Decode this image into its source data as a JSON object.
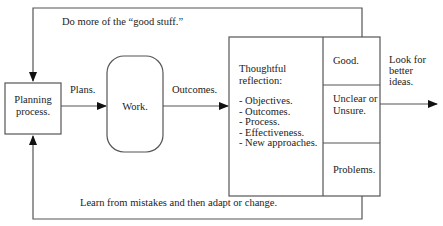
{
  "diagram": {
    "type": "feedback-loop flowchart",
    "colors": {
      "line": "#555555",
      "arrow": "#111111",
      "text": "#222222",
      "background": "#ffffff"
    },
    "nodes": {
      "planning": {
        "label_line1": "Planning",
        "label_line2": "process."
      },
      "work": {
        "label": "Work."
      },
      "reflection": {
        "title_line1": "Thoughtful",
        "title_line2": "reflection:",
        "items": [
          "- Objectives.",
          "- Outcomes.",
          "- Process.",
          "- Effectiveness.",
          "- New approaches."
        ]
      },
      "results": {
        "good": "Good.",
        "unclear_line1": "Unclear or",
        "unclear_line2": "Unsure.",
        "problems": "Problems."
      }
    },
    "edges": {
      "plans": "Plans.",
      "outcomes": "Outcomes.",
      "top_loop": "Do more of the “good stuff.”",
      "bottom_loop": "Learn from mistakes and then adapt or change.",
      "output_line1": "Look for",
      "output_line2": "better",
      "output_line3": "ideas."
    }
  }
}
